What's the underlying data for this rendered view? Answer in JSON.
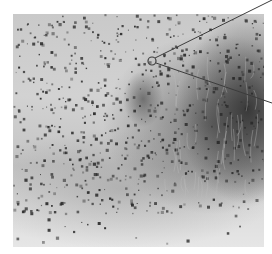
{
  "image": {
    "type": "grayscale micrograph",
    "frame": {
      "x": 13,
      "y": 14,
      "width": 251,
      "height": 233
    },
    "colors": {
      "background": "#ffffff",
      "light_tissue": "#d2d2d2",
      "dark_tissue": "#3a3a3a",
      "granules": "#2a2a2a",
      "annotation_line": "#3c3c3c"
    }
  },
  "annotation": {
    "marker": {
      "shape": "circle",
      "cx": 152,
      "cy": 61,
      "r": 4
    },
    "leader_lines": [
      {
        "from": [
          155,
          58
        ],
        "to": [
          272,
          0
        ]
      },
      {
        "from": [
          156,
          63
        ],
        "to": [
          272,
          103
        ]
      }
    ]
  },
  "texture": {
    "dot_count": 900,
    "seed": 7
  }
}
